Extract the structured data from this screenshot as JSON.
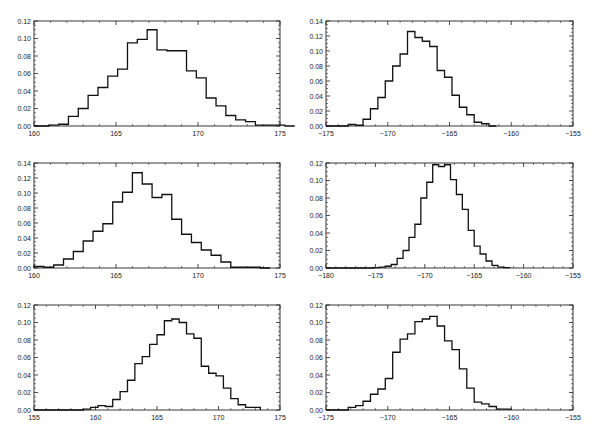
{
  "chart_data": [
    {
      "type": "bar",
      "subtype": "step-histogram",
      "panel": "top-left",
      "title": "",
      "xlabel": "",
      "ylabel": "",
      "xlim": [
        160,
        175
      ],
      "ylim": [
        0,
        0.12
      ],
      "xticks": [
        "160",
        "165",
        "170",
        "175"
      ],
      "yticks": [
        "0.00",
        "0.02",
        "0.04",
        "0.06",
        "0.08",
        "0.10",
        "0.12"
      ],
      "grid": false,
      "legend": null,
      "bin_start": 160.9,
      "bin_width": 0.6,
      "values": [
        0.001,
        0.002,
        0.011,
        0.02,
        0.035,
        0.044,
        0.057,
        0.065,
        0.095,
        0.099,
        0.11,
        0.087,
        0.086,
        0.086,
        0.063,
        0.055,
        0.032,
        0.023,
        0.012,
        0.007,
        0.005,
        0.001,
        0.001,
        0.001,
        0.0
      ]
    },
    {
      "type": "bar",
      "subtype": "step-histogram",
      "panel": "top-right",
      "title": "",
      "xlabel": "",
      "ylabel": "",
      "xlim": [
        -175,
        -155
      ],
      "ylim": [
        0,
        0.14
      ],
      "xticks": [
        "-175",
        "-170",
        "-165",
        "-160",
        "-155"
      ],
      "yticks": [
        "0.00",
        "0.02",
        "0.04",
        "0.06",
        "0.08",
        "0.10",
        "0.12",
        "0.14"
      ],
      "grid": false,
      "legend": null,
      "bin_start": -173.2,
      "bin_width": 0.6,
      "values": [
        0.002,
        0.001,
        0.009,
        0.023,
        0.038,
        0.06,
        0.08,
        0.096,
        0.126,
        0.118,
        0.113,
        0.106,
        0.074,
        0.065,
        0.041,
        0.025,
        0.015,
        0.005,
        0.003,
        0.0
      ]
    },
    {
      "type": "bar",
      "subtype": "step-histogram",
      "panel": "middle-left",
      "title": "",
      "xlabel": "",
      "ylabel": "",
      "xlim": [
        160,
        175
      ],
      "ylim": [
        0,
        0.14
      ],
      "xticks": [
        "160",
        "165",
        "170",
        "175"
      ],
      "yticks": [
        "0.00",
        "0.02",
        "0.04",
        "0.06",
        "0.08",
        "0.10",
        "0.12",
        "0.14"
      ],
      "grid": false,
      "legend": null,
      "bin_start": 160.0,
      "bin_width": 0.6,
      "values": [
        0.002,
        0.001,
        0.004,
        0.012,
        0.022,
        0.036,
        0.049,
        0.059,
        0.088,
        0.101,
        0.127,
        0.112,
        0.094,
        0.098,
        0.065,
        0.045,
        0.034,
        0.024,
        0.017,
        0.008,
        0.001,
        0.001,
        0.001,
        0.0
      ]
    },
    {
      "type": "bar",
      "subtype": "step-histogram",
      "panel": "middle-right",
      "title": "",
      "xlabel": "",
      "ylabel": "",
      "xlim": [
        -180,
        -155
      ],
      "ylim": [
        0,
        0.12
      ],
      "xticks": [
        "-180",
        "-175",
        "-170",
        "-165",
        "-160",
        "-155"
      ],
      "yticks": [
        "0.00",
        "0.02",
        "0.04",
        "0.06",
        "0.08",
        "0.10",
        "0.12"
      ],
      "grid": false,
      "legend": null,
      "bin_start": -175.2,
      "bin_width": 0.6,
      "values": [
        0.0005,
        0.001,
        0.002,
        0.004,
        0.011,
        0.02,
        0.035,
        0.05,
        0.08,
        0.098,
        0.118,
        0.116,
        0.118,
        0.101,
        0.084,
        0.067,
        0.043,
        0.025,
        0.016,
        0.008,
        0.003,
        0.001,
        0.0005
      ]
    },
    {
      "type": "bar",
      "subtype": "step-histogram",
      "panel": "bottom-left",
      "title": "",
      "xlabel": "",
      "ylabel": "",
      "xlim": [
        155,
        175
      ],
      "ylim": [
        0,
        0.12
      ],
      "xticks": [
        "155",
        "160",
        "165",
        "170",
        "175"
      ],
      "yticks": [
        "0.00",
        "0.02",
        "0.04",
        "0.06",
        "0.08",
        "0.10",
        "0.12"
      ],
      "grid": false,
      "legend": null,
      "bin_start": 159.0,
      "bin_width": 0.6,
      "values": [
        0.001,
        0.003,
        0.005,
        0.004,
        0.012,
        0.021,
        0.034,
        0.053,
        0.061,
        0.075,
        0.086,
        0.102,
        0.104,
        0.1,
        0.087,
        0.082,
        0.05,
        0.042,
        0.039,
        0.025,
        0.013,
        0.006,
        0.003,
        0.003
      ]
    },
    {
      "type": "bar",
      "subtype": "step-histogram",
      "panel": "bottom-right",
      "title": "",
      "xlabel": "",
      "ylabel": "",
      "xlim": [
        -175,
        -155
      ],
      "ylim": [
        0,
        0.12
      ],
      "xticks": [
        "-175",
        "-170",
        "-165",
        "-160",
        "-155"
      ],
      "yticks": [
        "0.00",
        "0.02",
        "0.04",
        "0.06",
        "0.08",
        "0.10",
        "0.12"
      ],
      "grid": false,
      "legend": null,
      "bin_start": -173.2,
      "bin_width": 0.6,
      "values": [
        0.003,
        0.005,
        0.01,
        0.018,
        0.024,
        0.036,
        0.066,
        0.081,
        0.087,
        0.101,
        0.104,
        0.107,
        0.096,
        0.079,
        0.069,
        0.047,
        0.025,
        0.009,
        0.007,
        0.004,
        0.001,
        0.001
      ]
    }
  ],
  "layout": {
    "panels": [
      {
        "left": 34,
        "top": 21,
        "right": 280,
        "bottom": 126
      },
      {
        "left": 326,
        "top": 21,
        "right": 573,
        "bottom": 126
      },
      {
        "left": 34,
        "top": 163,
        "right": 280,
        "bottom": 268
      },
      {
        "left": 326,
        "top": 163,
        "right": 573,
        "bottom": 268
      },
      {
        "left": 34,
        "top": 305,
        "right": 280,
        "bottom": 410
      },
      {
        "left": 326,
        "top": 305,
        "right": 573,
        "bottom": 410
      }
    ],
    "line_color": "#111111",
    "frame_color": "#222222"
  }
}
